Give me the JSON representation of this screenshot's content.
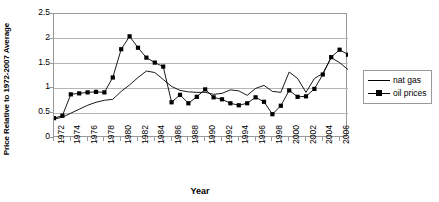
{
  "chart_data": {
    "type": "line",
    "title": "",
    "xlabel": "Year",
    "ylabel": "Price Relative to 1972-2007 Average",
    "xlim": [
      1972,
      2007
    ],
    "ylim": [
      0,
      2.5
    ],
    "y_ticks": [
      0,
      0.5,
      1,
      1.5,
      2,
      2.5
    ],
    "y_tick_labels": [
      "0",
      "0.5",
      "1",
      "1.5",
      "2",
      "2.5"
    ],
    "x_tick_labels": [
      "1972",
      "1974",
      "1976",
      "1978",
      "1980",
      "1982",
      "1984",
      "1986",
      "1988",
      "1990",
      "1992",
      "1994",
      "1996",
      "1998",
      "2000",
      "2002",
      "2004",
      "2006"
    ],
    "x_all_ticks": [
      1972,
      1973,
      1974,
      1975,
      1976,
      1977,
      1978,
      1979,
      1980,
      1981,
      1982,
      1983,
      1984,
      1985,
      1986,
      1987,
      1988,
      1989,
      1990,
      1991,
      1992,
      1993,
      1994,
      1995,
      1996,
      1997,
      1998,
      1999,
      2000,
      2001,
      2002,
      2003,
      2004,
      2005,
      2006,
      2007
    ],
    "grid": "horizontal",
    "legend_position": "right",
    "x": [
      1972,
      1973,
      1974,
      1975,
      1976,
      1977,
      1978,
      1979,
      1980,
      1981,
      1982,
      1983,
      1984,
      1985,
      1986,
      1987,
      1988,
      1989,
      1990,
      1991,
      1992,
      1993,
      1994,
      1995,
      1996,
      1997,
      1998,
      1999,
      2000,
      2001,
      2002,
      2003,
      2004,
      2005,
      2006,
      2007
    ],
    "series": [
      {
        "name": "nat gas",
        "marker": "none",
        "color": "#000000",
        "values": [
          0.38,
          0.42,
          0.5,
          0.58,
          0.66,
          0.72,
          0.76,
          0.78,
          0.94,
          1.07,
          1.22,
          1.35,
          1.32,
          1.18,
          1.04,
          0.96,
          0.93,
          0.92,
          0.92,
          0.88,
          0.9,
          0.97,
          0.95,
          0.86,
          1.0,
          1.06,
          0.94,
          0.92,
          1.33,
          1.2,
          0.92,
          1.2,
          1.3,
          1.62,
          1.52,
          1.38
        ]
      },
      {
        "name": "oil prices",
        "marker": "square",
        "color": "#000000",
        "values": [
          0.4,
          0.45,
          0.88,
          0.9,
          0.92,
          0.93,
          0.92,
          1.22,
          1.79,
          2.05,
          1.82,
          1.62,
          1.52,
          1.44,
          0.72,
          0.87,
          0.7,
          0.83,
          0.98,
          0.82,
          0.78,
          0.7,
          0.66,
          0.7,
          0.82,
          0.73,
          0.48,
          0.65,
          0.96,
          0.83,
          0.84,
          0.99,
          1.28,
          1.63,
          1.78,
          1.68
        ]
      }
    ]
  },
  "legend": {
    "items": [
      {
        "label": "nat gas",
        "marker": "none"
      },
      {
        "label": "oil prices",
        "marker": "square"
      }
    ]
  },
  "axes": {
    "y_title": "Price Relative to 1972-2007 Average",
    "x_title": "Year"
  }
}
